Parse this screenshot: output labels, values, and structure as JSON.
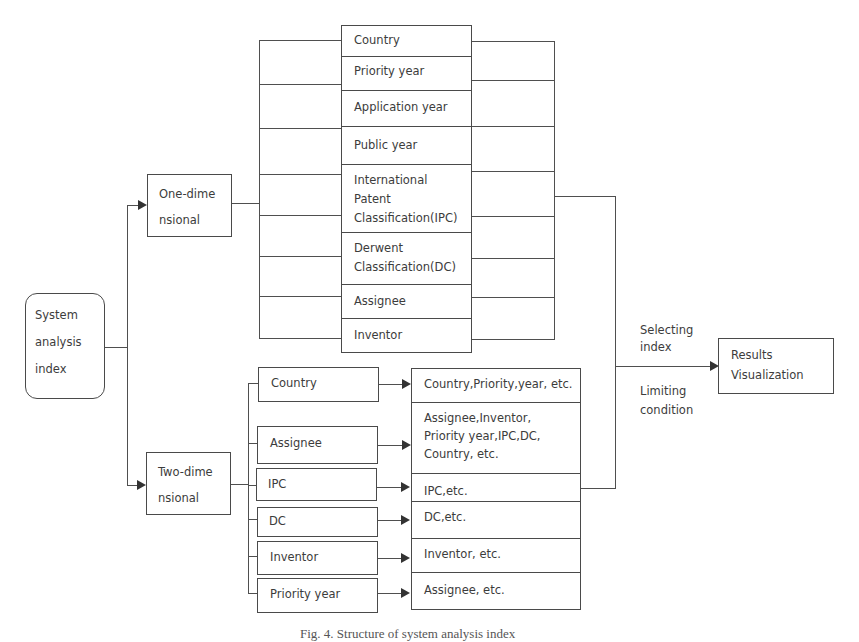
{
  "diagram": {
    "root": {
      "label_lines": [
        "System",
        "analysis",
        "index"
      ]
    },
    "one_dimensional": {
      "label_lines": [
        "One-dime",
        "nsional"
      ],
      "items": [
        {
          "label": "Country"
        },
        {
          "label": "Priority year"
        },
        {
          "label": "Application year"
        },
        {
          "label": "Public year"
        },
        {
          "label_lines": [
            "International",
            "Patent",
            "Classification(IPC)"
          ]
        },
        {
          "label_lines": [
            "Derwent",
            "Classification(DC)"
          ]
        },
        {
          "label": "Assignee"
        },
        {
          "label": "Inventor"
        }
      ]
    },
    "two_dimensional": {
      "label_lines": [
        "Two-dime",
        "nsional"
      ],
      "pairs": [
        {
          "dimension": "Country",
          "targets": [
            "Country,Priority,year, etc."
          ]
        },
        {
          "dimension": "Assignee",
          "targets": [
            "Assignee,Inventor,",
            "Priority year,IPC,DC,",
            "Country, etc."
          ]
        },
        {
          "dimension": "IPC",
          "targets": [
            "IPC,etc."
          ]
        },
        {
          "dimension": "DC",
          "targets": [
            "DC,etc."
          ]
        },
        {
          "dimension": "Inventor",
          "targets": [
            "Inventor, etc."
          ]
        },
        {
          "dimension": "Priority year",
          "targets": [
            "Assignee, etc."
          ]
        }
      ]
    },
    "connector_labels": {
      "selecting": [
        "Selecting",
        "index"
      ],
      "limiting": [
        "Limiting",
        "condition"
      ]
    },
    "output": {
      "label_lines": [
        "Results",
        "Visualization"
      ]
    }
  },
  "caption": "Fig. 4. Structure of system analysis index"
}
